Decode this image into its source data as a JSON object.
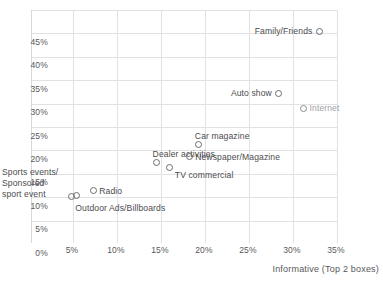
{
  "chart_data": {
    "type": "scatter",
    "title": "",
    "xlabel": "Informative (Top 2 boxes)",
    "ylabel": "",
    "xlim": [
      0,
      37.5
    ],
    "ylim": [
      0,
      47
    ],
    "grid": true,
    "legend": "none",
    "xticks": [
      "5%",
      "10%",
      "15%",
      "20%",
      "25%",
      "30%",
      "35%"
    ],
    "xtick_values": [
      5,
      10,
      15,
      20,
      25,
      30,
      35
    ],
    "yticks": [
      "0%",
      "5%",
      "10%",
      "15%",
      "20%",
      "25%",
      "30%",
      "35%",
      "40%",
      "45%"
    ],
    "ytick_values": [
      0,
      5,
      10,
      15,
      20,
      25,
      30,
      35,
      40,
      45
    ],
    "points": [
      {
        "label": "Family/Friends",
        "x": 33.0,
        "y": 40.5,
        "label_pos": "left",
        "style": "dark"
      },
      {
        "label": "Auto show",
        "x": 28.4,
        "y": 27.2,
        "label_pos": "left",
        "style": "dark"
      },
      {
        "label": "Internet",
        "x": 31.2,
        "y": 24.0,
        "label_pos": "right",
        "style": "light"
      },
      {
        "label": "Car magazine",
        "x": 19.3,
        "y": 16.2,
        "label_pos": "above",
        "style": "dark"
      },
      {
        "label": "Newspaper/Magazine",
        "x": 18.2,
        "y": 13.6,
        "label_pos": "right",
        "style": "dark"
      },
      {
        "label": "TV commercial",
        "x": 16.0,
        "y": 11.4,
        "label_pos": "below-right",
        "style": "dark"
      },
      {
        "label": "Dealer activities",
        "x": 14.5,
        "y": 12.4,
        "label_pos": "above",
        "style": "dark"
      },
      {
        "label": "Radio",
        "x": 7.3,
        "y": 6.4,
        "label_pos": "right",
        "style": "dark"
      },
      {
        "label": "Sports events/ Sponsored sport event",
        "x": 5.4,
        "y": 5.3,
        "label_pos": "left",
        "style": "dark"
      },
      {
        "label": "Outdoor Ads/Billboards",
        "x": 4.8,
        "y": 5.2,
        "label_pos": "below",
        "style": "dark"
      }
    ],
    "annotations": {
      "sports_event_line1": "Sports events/",
      "sports_event_line2": "Sponsored",
      "sports_event_line3": "sport event"
    },
    "top_clipped_text": ""
  }
}
